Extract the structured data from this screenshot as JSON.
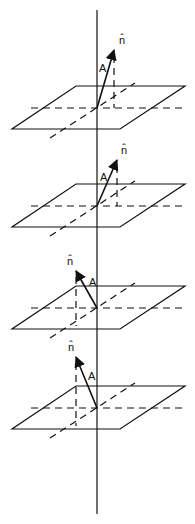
{
  "figure": {
    "axis": {
      "x": 97,
      "y_top": 10,
      "y_bottom": 514
    },
    "planes": [
      {
        "label_vector": "A",
        "label_normal": "n̂",
        "origin_y": 108,
        "tip": [
          114,
          50
        ],
        "normal_label_pos": [
          119,
          44
        ],
        "vector_label_pos": [
          99,
          72
        ],
        "dropline_x": 114
      },
      {
        "label_vector": "A",
        "label_normal": "n̂",
        "origin_y": 206,
        "tip": [
          117,
          160
        ],
        "normal_label_pos": [
          121,
          154
        ],
        "vector_label_pos": [
          100,
          181
        ],
        "dropline_x": 117
      },
      {
        "label_vector": "A",
        "label_normal": "n̂",
        "origin_y": 308,
        "tip": [
          76,
          271
        ],
        "normal_label_pos": [
          67,
          265
        ],
        "vector_label_pos": [
          89,
          286
        ],
        "dropline_x": 76
      },
      {
        "label_vector": "A",
        "label_normal": "n̂",
        "origin_y": 408,
        "tip": [
          76,
          357
        ],
        "normal_label_pos": [
          68,
          351
        ],
        "vector_label_pos": [
          88,
          380
        ],
        "dropline_x": 76
      }
    ]
  }
}
